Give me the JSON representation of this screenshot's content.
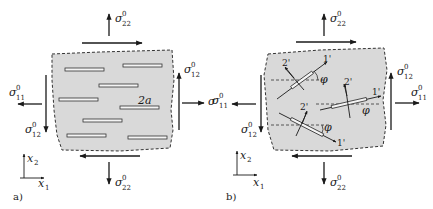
{
  "figure": {
    "panels": [
      {
        "id": "a",
        "label": "a)",
        "crack_size_label": "2a",
        "stress_labels": {
          "top": {
            "symbol": "σ",
            "sup": "0",
            "sub": "22"
          },
          "bottom": {
            "symbol": "σ",
            "sup": "0",
            "sub": "22"
          },
          "left_normal": {
            "symbol": "σ",
            "sup": "0",
            "sub": "11"
          },
          "right_normal": {
            "symbol": "σ",
            "sup": "0",
            "sub": "11"
          },
          "left_shear": {
            "symbol": "σ",
            "sup": "0",
            "sub": "12"
          },
          "right_shear": {
            "symbol": "σ",
            "sup": "0",
            "sub": "12"
          }
        },
        "axes": {
          "x1": "x",
          "x1_sub": "1",
          "x2": "x",
          "x2_sub": "2"
        }
      },
      {
        "id": "b",
        "label": "b)",
        "local_axes": {
          "axis1": "1'",
          "axis2": "2'",
          "angle": "φ"
        },
        "stress_labels": {
          "top": {
            "symbol": "σ",
            "sup": "0",
            "sub": "22"
          },
          "bottom": {
            "symbol": "σ",
            "sup": "0",
            "sub": "22"
          },
          "left_normal": {
            "symbol": "σ",
            "sup": "0",
            "sub": "11"
          },
          "right_normal": {
            "symbol": "σ",
            "sup": "0",
            "sub": "11"
          },
          "left_shear": {
            "symbol": "σ",
            "sup": "0",
            "sub": "12"
          },
          "right_shear": {
            "symbol": "σ",
            "sup": "0",
            "sub": "12"
          }
        },
        "axes": {
          "x1": "x",
          "x1_sub": "1",
          "x2": "x",
          "x2_sub": "2"
        }
      }
    ],
    "colors": {
      "fill": "#d9d9d9",
      "stroke": "#2a2a2a",
      "background": "#ffffff"
    }
  }
}
